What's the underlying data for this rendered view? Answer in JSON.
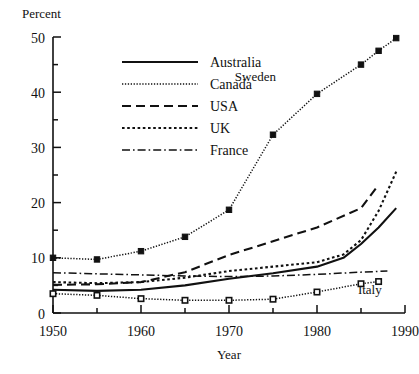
{
  "chart_data": {
    "type": "line",
    "title": "",
    "xlabel": "Year",
    "ylabel": "Percent",
    "xlim": [
      1950,
      1990
    ],
    "ylim": [
      0,
      50
    ],
    "x_ticks_major": [
      1950,
      1960,
      1970,
      1980,
      1990
    ],
    "x_ticks_minor": [
      1955,
      1965,
      1975,
      1985
    ],
    "y_ticks_major": [
      0,
      10,
      20,
      30,
      40,
      50
    ],
    "y_ticks_minor": [
      5,
      15,
      25,
      35,
      45
    ],
    "grid": false,
    "legend_position": "upper-left-inside",
    "series": [
      {
        "name": "Australia",
        "style": "solid",
        "marker": "none",
        "x": [
          1950,
          1955,
          1960,
          1965,
          1970,
          1975,
          1980,
          1983,
          1985,
          1987,
          1989
        ],
        "values": [
          4.2,
          4.0,
          4.2,
          5.0,
          6.2,
          7.2,
          8.4,
          10.0,
          12.5,
          15.5,
          19.0
        ]
      },
      {
        "name": "Canada",
        "style": "fine-dotted",
        "marker": "filled-square",
        "x": [
          1950,
          1955,
          1960,
          1965,
          1970,
          1975,
          1980,
          1985,
          1987,
          1989
        ],
        "values": [
          10.0,
          9.7,
          11.2,
          13.8,
          18.7,
          32.3,
          39.7,
          45.0,
          47.5,
          49.8
        ]
      },
      {
        "name": "USA",
        "style": "dashed",
        "marker": "none",
        "x": [
          1950,
          1955,
          1960,
          1965,
          1970,
          1975,
          1980,
          1985,
          1987
        ],
        "values": [
          5.1,
          5.2,
          5.6,
          7.4,
          10.5,
          13.0,
          15.5,
          19.0,
          23.2
        ]
      },
      {
        "name": "UK",
        "style": "dotted",
        "marker": "none",
        "x": [
          1950,
          1955,
          1960,
          1965,
          1970,
          1975,
          1980,
          1983,
          1985,
          1987,
          1989
        ],
        "values": [
          5.6,
          5.4,
          5.6,
          6.4,
          7.6,
          8.4,
          9.2,
          10.6,
          13.2,
          18.5,
          25.6
        ]
      },
      {
        "name": "France",
        "style": "dash-dot",
        "marker": "none",
        "x": [
          1950,
          1955,
          1960,
          1965,
          1970,
          1975,
          1980,
          1985,
          1988
        ],
        "values": [
          7.3,
          7.1,
          6.9,
          6.7,
          6.6,
          6.7,
          7.0,
          7.4,
          7.6
        ]
      },
      {
        "name": "Italy",
        "style": "fine-dotted",
        "marker": "open-square",
        "x": [
          1950,
          1955,
          1960,
          1965,
          1970,
          1975,
          1980,
          1985,
          1987
        ],
        "values": [
          3.5,
          3.2,
          2.6,
          2.3,
          2.3,
          2.5,
          3.8,
          5.3,
          5.7
        ]
      }
    ],
    "annotations": [
      {
        "text": "Sweden",
        "x": 1973,
        "y": 42.0
      },
      {
        "text": "Italy",
        "x": 1986,
        "y": 3.4
      }
    ]
  },
  "legend": {
    "entries": [
      {
        "label": "Australia",
        "style": "solid"
      },
      {
        "label": "Canada",
        "style": "fine-dotted"
      },
      {
        "label": "USA",
        "style": "dashed"
      },
      {
        "label": "UK",
        "style": "dotted"
      },
      {
        "label": "France",
        "style": "dash-dot"
      }
    ]
  },
  "colors": {
    "ink": "#111111",
    "background": "#ffffff"
  }
}
